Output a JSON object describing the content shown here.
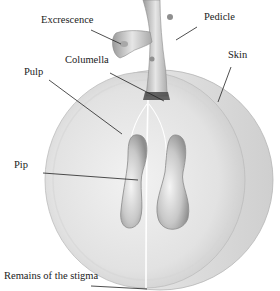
{
  "figure": {
    "labels": [
      {
        "id": "excrescence",
        "text": "Excrescence"
      },
      {
        "id": "pedicle",
        "text": "Pedicle"
      },
      {
        "id": "skin",
        "text": "Skin"
      },
      {
        "id": "columella",
        "text": "Columella"
      },
      {
        "id": "pulp",
        "text": "Pulp"
      },
      {
        "id": "pip",
        "text": "Pip"
      },
      {
        "id": "stigma",
        "text": "Remains of the stigma"
      }
    ]
  }
}
